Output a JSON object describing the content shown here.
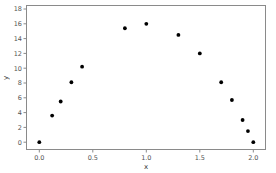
{
  "chart_data": {
    "type": "scatter",
    "title": "",
    "xlabel": "x",
    "ylabel": "y",
    "xlim": [
      -0.1,
      2.1
    ],
    "ylim": [
      -1,
      18
    ],
    "xticks": [
      0.0,
      0.5,
      1.0,
      1.5,
      2.0
    ],
    "xtick_labels": [
      "0.0",
      "0.5",
      "1.0",
      "1.5",
      "2.0"
    ],
    "yticks": [
      0,
      2,
      4,
      6,
      8,
      10,
      12,
      14,
      16,
      18
    ],
    "ytick_labels": [
      "0",
      "2",
      "4",
      "6",
      "8",
      "10",
      "12",
      "14",
      "16",
      "18"
    ],
    "grid": false,
    "legend": null,
    "series": [
      {
        "name": "points",
        "color": "#000000",
        "x": [
          0.0,
          0.12,
          0.2,
          0.3,
          0.4,
          0.8,
          1.0,
          1.3,
          1.5,
          1.7,
          1.8,
          1.9,
          1.95,
          2.0
        ],
        "y": [
          0.0,
          3.6,
          5.5,
          8.1,
          10.2,
          15.4,
          16.0,
          14.5,
          12.0,
          8.1,
          5.7,
          3.0,
          1.5,
          0.0
        ]
      }
    ]
  },
  "colors": {
    "frame": "#8a8a8a",
    "tick": "#8a8a8a",
    "marker": "#000000",
    "background": "#ffffff"
  }
}
